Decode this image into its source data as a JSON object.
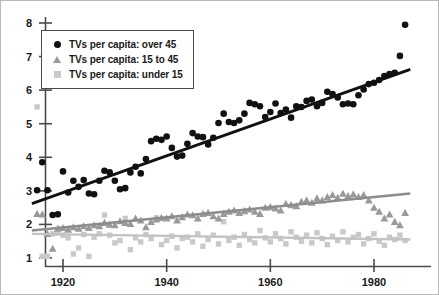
{
  "chart_data": {
    "type": "scatter",
    "title": "",
    "xlabel": "",
    "ylabel": "",
    "xlim": [
      1913,
      1989
    ],
    "ylim": [
      0.75,
      8.35
    ],
    "xticks": [
      1920,
      1940,
      1960,
      1980
    ],
    "yticks": [
      1,
      2,
      3,
      4,
      5,
      6,
      7,
      8
    ],
    "grid": false,
    "legend_position": "top-left",
    "series": [
      {
        "name": "TVs per capita: over 45",
        "marker": "circle",
        "color": "#111111",
        "trendline": {
          "x": [
            1914,
            1987
          ],
          "y": [
            2.62,
            6.62
          ],
          "color": "#111111"
        },
        "points": [
          [
            1915,
            3.02
          ],
          [
            1916,
            3.85
          ],
          [
            1917,
            3.02
          ],
          [
            1918,
            2.28
          ],
          [
            1919,
            2.3
          ],
          [
            1920,
            3.58
          ],
          [
            1921,
            2.95
          ],
          [
            1922,
            3.3
          ],
          [
            1923,
            3.12
          ],
          [
            1924,
            3.32
          ],
          [
            1925,
            2.92
          ],
          [
            1926,
            2.9
          ],
          [
            1927,
            3.3
          ],
          [
            1928,
            3.6
          ],
          [
            1929,
            3.55
          ],
          [
            1930,
            3.3
          ],
          [
            1931,
            3.05
          ],
          [
            1932,
            3.08
          ],
          [
            1933,
            3.55
          ],
          [
            1934,
            3.72
          ],
          [
            1935,
            3.52
          ],
          [
            1936,
            3.95
          ],
          [
            1937,
            4.48
          ],
          [
            1938,
            4.55
          ],
          [
            1939,
            4.52
          ],
          [
            1940,
            4.62
          ],
          [
            1941,
            4.28
          ],
          [
            1942,
            4.02
          ],
          [
            1943,
            4.05
          ],
          [
            1944,
            4.4
          ],
          [
            1945,
            4.72
          ],
          [
            1946,
            4.62
          ],
          [
            1947,
            4.6
          ],
          [
            1948,
            4.38
          ],
          [
            1949,
            4.58
          ],
          [
            1950,
            5.02
          ],
          [
            1951,
            5.3
          ],
          [
            1952,
            5.05
          ],
          [
            1953,
            5.02
          ],
          [
            1954,
            5.1
          ],
          [
            1955,
            5.3
          ],
          [
            1956,
            5.62
          ],
          [
            1957,
            5.58
          ],
          [
            1958,
            5.52
          ],
          [
            1959,
            5.2
          ],
          [
            1960,
            5.35
          ],
          [
            1961,
            5.6
          ],
          [
            1962,
            5.32
          ],
          [
            1963,
            5.42
          ],
          [
            1964,
            5.18
          ],
          [
            1965,
            5.52
          ],
          [
            1966,
            5.5
          ],
          [
            1967,
            5.68
          ],
          [
            1968,
            5.72
          ],
          [
            1969,
            5.52
          ],
          [
            1970,
            5.62
          ],
          [
            1971,
            5.95
          ],
          [
            1972,
            5.88
          ],
          [
            1973,
            5.78
          ],
          [
            1974,
            5.58
          ],
          [
            1975,
            5.6
          ],
          [
            1976,
            5.58
          ],
          [
            1977,
            5.85
          ],
          [
            1978,
            6.02
          ],
          [
            1979,
            6.18
          ],
          [
            1980,
            6.22
          ],
          [
            1981,
            6.3
          ],
          [
            1982,
            6.42
          ],
          [
            1983,
            6.48
          ],
          [
            1984,
            6.52
          ],
          [
            1985,
            7.02
          ],
          [
            1986,
            7.95
          ]
        ]
      },
      {
        "name": "TVs per capita: 15 to 45",
        "marker": "triangle",
        "color": "#9a9a9a",
        "trendline": {
          "x": [
            1914,
            1987
          ],
          "y": [
            1.82,
            2.92
          ],
          "color": "#8c8c8c"
        },
        "points": [
          [
            1915,
            2.32
          ],
          [
            1916,
            2.3
          ],
          [
            1917,
            1.72
          ],
          [
            1918,
            1.28
          ],
          [
            1919,
            1.88
          ],
          [
            1920,
            1.9
          ],
          [
            1921,
            1.85
          ],
          [
            1922,
            1.92
          ],
          [
            1923,
            1.88
          ],
          [
            1924,
            1.95
          ],
          [
            1925,
            1.9
          ],
          [
            1926,
            1.98
          ],
          [
            1927,
            1.95
          ],
          [
            1928,
            2.05
          ],
          [
            1929,
            2.0
          ],
          [
            1930,
            1.98
          ],
          [
            1931,
            2.1
          ],
          [
            1932,
            2.05
          ],
          [
            1933,
            2.02
          ],
          [
            1934,
            2.18
          ],
          [
            1935,
            2.12
          ],
          [
            1936,
            1.92
          ],
          [
            1937,
            2.08
          ],
          [
            1938,
            2.15
          ],
          [
            1939,
            2.2
          ],
          [
            1940,
            2.18
          ],
          [
            1941,
            2.25
          ],
          [
            1942,
            2.12
          ],
          [
            1943,
            2.22
          ],
          [
            1944,
            2.3
          ],
          [
            1945,
            2.28
          ],
          [
            1946,
            2.18
          ],
          [
            1947,
            2.32
          ],
          [
            1948,
            2.35
          ],
          [
            1949,
            2.25
          ],
          [
            1950,
            2.18
          ],
          [
            1951,
            2.32
          ],
          [
            1952,
            2.38
          ],
          [
            1953,
            2.42
          ],
          [
            1954,
            2.35
          ],
          [
            1955,
            2.4
          ],
          [
            1956,
            2.45
          ],
          [
            1957,
            2.38
          ],
          [
            1958,
            2.32
          ],
          [
            1959,
            2.5
          ],
          [
            1960,
            2.52
          ],
          [
            1961,
            2.48
          ],
          [
            1962,
            2.42
          ],
          [
            1963,
            2.62
          ],
          [
            1964,
            2.58
          ],
          [
            1965,
            2.55
          ],
          [
            1966,
            2.68
          ],
          [
            1967,
            2.72
          ],
          [
            1968,
            2.65
          ],
          [
            1969,
            2.78
          ],
          [
            1970,
            2.72
          ],
          [
            1971,
            2.82
          ],
          [
            1972,
            2.88
          ],
          [
            1973,
            2.8
          ],
          [
            1974,
            2.92
          ],
          [
            1975,
            2.85
          ],
          [
            1976,
            2.9
          ],
          [
            1977,
            2.82
          ],
          [
            1978,
            2.88
          ],
          [
            1979,
            2.72
          ],
          [
            1980,
            2.5
          ],
          [
            1981,
            2.38
          ],
          [
            1982,
            2.18
          ],
          [
            1983,
            2.3
          ],
          [
            1984,
            2.08
          ],
          [
            1985,
            1.98
          ],
          [
            1986,
            2.35
          ]
        ]
      },
      {
        "name": "TVs per capita: under 15",
        "marker": "square",
        "color": "#c9c9c9",
        "trendline": {
          "x": [
            1914,
            1987
          ],
          "y": [
            1.72,
            1.55
          ],
          "color": "#c2c2c2"
        },
        "points": [
          [
            1915,
            5.5
          ],
          [
            1916,
            1.05
          ],
          [
            1917,
            1.05
          ],
          [
            1918,
            1.72
          ],
          [
            1919,
            1.75
          ],
          [
            1920,
            1.68
          ],
          [
            1921,
            1.6
          ],
          [
            1922,
            1.12
          ],
          [
            1923,
            1.3
          ],
          [
            1924,
            1.7
          ],
          [
            1925,
            1.05
          ],
          [
            1926,
            1.62
          ],
          [
            1927,
            1.72
          ],
          [
            1928,
            2.28
          ],
          [
            1929,
            1.68
          ],
          [
            1930,
            1.45
          ],
          [
            1931,
            1.52
          ],
          [
            1932,
            2.18
          ],
          [
            1933,
            1.25
          ],
          [
            1934,
            1.6
          ],
          [
            1935,
            1.48
          ],
          [
            1936,
            1.7
          ],
          [
            1937,
            1.58
          ],
          [
            1938,
            2.2
          ],
          [
            1939,
            1.4
          ],
          [
            1940,
            1.52
          ],
          [
            1941,
            1.65
          ],
          [
            1942,
            1.3
          ],
          [
            1943,
            1.58
          ],
          [
            1944,
            1.62
          ],
          [
            1945,
            1.48
          ],
          [
            1946,
            1.72
          ],
          [
            1947,
            1.35
          ],
          [
            1948,
            1.55
          ],
          [
            1949,
            1.68
          ],
          [
            1950,
            1.42
          ],
          [
            1951,
            2.08
          ],
          [
            1952,
            1.52
          ],
          [
            1953,
            1.62
          ],
          [
            1954,
            1.38
          ],
          [
            1955,
            1.7
          ],
          [
            1956,
            1.55
          ],
          [
            1957,
            1.45
          ],
          [
            1958,
            1.82
          ],
          [
            1959,
            1.6
          ],
          [
            1960,
            1.48
          ],
          [
            1961,
            1.72
          ],
          [
            1962,
            1.58
          ],
          [
            1963,
            1.42
          ],
          [
            1964,
            1.78
          ],
          [
            1965,
            1.62
          ],
          [
            1966,
            1.5
          ],
          [
            1967,
            1.68
          ],
          [
            1968,
            1.45
          ],
          [
            1969,
            1.75
          ],
          [
            1970,
            1.58
          ],
          [
            1971,
            1.4
          ],
          [
            1972,
            1.65
          ],
          [
            1973,
            1.52
          ],
          [
            1974,
            1.78
          ],
          [
            1975,
            1.48
          ],
          [
            1976,
            1.62
          ],
          [
            1977,
            1.7
          ],
          [
            1978,
            1.42
          ],
          [
            1979,
            1.58
          ],
          [
            1980,
            1.72
          ],
          [
            1981,
            1.5
          ],
          [
            1982,
            1.38
          ],
          [
            1983,
            1.62
          ],
          [
            1984,
            1.55
          ],
          [
            1985,
            1.68
          ],
          [
            1986,
            1.52
          ]
        ]
      }
    ]
  },
  "legend": {
    "items": [
      {
        "label": "TVs per capita: over 45",
        "marker": "circle"
      },
      {
        "label": "TVs per capita: 15 to 45",
        "marker": "triangle"
      },
      {
        "label": "TVs per capita: under 15",
        "marker": "square"
      }
    ]
  },
  "axis": {
    "x_tick_labels": [
      "1920",
      "1940",
      "1960",
      "1980"
    ],
    "y_tick_labels": [
      "1",
      "2",
      "3",
      "4",
      "5",
      "6",
      "7",
      "8"
    ]
  }
}
